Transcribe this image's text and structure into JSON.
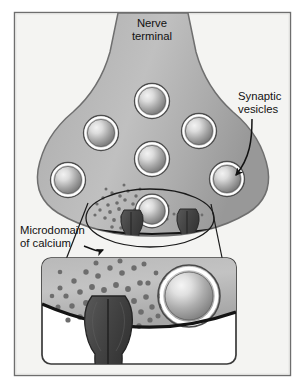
{
  "figure": {
    "frame": {
      "border_color": "#6e6e6e",
      "background_color": "#f4f4f2"
    },
    "labels": {
      "nerve_terminal": {
        "line1": "Nerve",
        "line2": "terminal"
      },
      "synaptic_vesicles": {
        "line1": "Synaptic",
        "line2": "vesicles"
      },
      "microdomain_of_calcium": {
        "line1": "Microdomain",
        "line2": "of calcium"
      }
    },
    "colors": {
      "terminal_fill": "#a8a8a8",
      "terminal_fill_light": "#c2c2c2",
      "terminal_outline": "#6b6b6b",
      "vesicle_core_highlight": "#e9e9e9",
      "vesicle_core_shadow": "#7d7d7d",
      "vesicle_ring": "#ffffff",
      "vesicle_outline": "#4a4a4a",
      "calcium_channel": "#4a4a4a",
      "calcium_ion": "#6d6d6d",
      "membrane_line": "#141414",
      "leader_line": "#121212",
      "text": "#111111",
      "inset_border": "#3a3a3a",
      "inset_background": "#ffffff",
      "page_background": "#ffffff"
    },
    "elements": {
      "vesicles_main": [
        {
          "cx": 152,
          "cy": 101,
          "r": 17
        },
        {
          "cx": 101,
          "cy": 133,
          "r": 17
        },
        {
          "cx": 199,
          "cy": 131,
          "r": 17
        },
        {
          "cx": 152,
          "cy": 159,
          "r": 17
        },
        {
          "cx": 68,
          "cy": 180,
          "r": 17
        },
        {
          "cx": 227,
          "cy": 179,
          "r": 17
        },
        {
          "cx": 152,
          "cy": 211,
          "r": 16
        }
      ],
      "vesicle_inset": {
        "cx": 189,
        "cy": 296,
        "r": 30
      },
      "channels_main": [
        {
          "x": 122,
          "y": 210,
          "w": 20,
          "h": 34
        },
        {
          "x": 178,
          "y": 209,
          "w": 20,
          "h": 34
        }
      ],
      "channel_inset": {
        "x": 87,
        "y": 296,
        "w": 40,
        "h": 78
      },
      "magnifier_ellipse": {
        "cx": 150,
        "cy": 218,
        "rx": 64,
        "ry": 29
      },
      "inset_box": {
        "x": 42,
        "y": 258,
        "w": 194,
        "h": 106,
        "radius": 9
      },
      "calcium_ion_count_main": 42,
      "calcium_ion_count_inset": 46
    }
  }
}
